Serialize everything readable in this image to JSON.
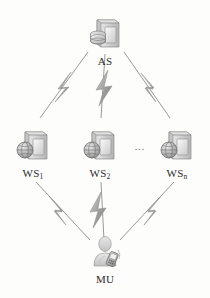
{
  "figure": {
    "type": "network-topology-diagram",
    "background_color": "#fdfdfc",
    "line_color": "#8d8d8d",
    "bolt_color": "#a8a8a8",
    "label_color": "#2b2b2b",
    "ellipsis": "..."
  },
  "nodes": [
    {
      "id": "as",
      "label": "AS",
      "label_base": "AS",
      "label_sub": "",
      "icon": "server-database-icon",
      "tier": "top",
      "x": 105,
      "y": 14
    },
    {
      "id": "ws1",
      "label": "WS1",
      "label_base": "WS",
      "label_sub": "1",
      "icon": "web-server-globe-icon",
      "tier": "middle",
      "x": 33,
      "y": 126
    },
    {
      "id": "ws2",
      "label": "WS2",
      "label_base": "WS",
      "label_sub": "2",
      "icon": "web-server-globe-icon",
      "tier": "middle",
      "x": 100,
      "y": 126
    },
    {
      "id": "wsn",
      "label": "WSn",
      "label_base": "WS",
      "label_sub": "n",
      "icon": "web-server-globe-icon",
      "tier": "middle",
      "x": 177,
      "y": 126
    },
    {
      "id": "mu",
      "label": "MU",
      "label_base": "MU",
      "label_sub": "",
      "icon": "mobile-user-icon",
      "tier": "bottom",
      "x": 105,
      "y": 232
    }
  ],
  "links": [
    {
      "id": "as-ws1",
      "from": "AS",
      "to": "WS1",
      "style": "lightning"
    },
    {
      "id": "as-ws2",
      "from": "AS",
      "to": "WS2",
      "style": "lightning"
    },
    {
      "id": "as-wsn",
      "from": "AS",
      "to": "WSn",
      "style": "lightning"
    },
    {
      "id": "ws1-mu",
      "from": "WS1",
      "to": "MU",
      "style": "lightning"
    },
    {
      "id": "ws2-mu",
      "from": "WS2",
      "to": "MU",
      "style": "lightning"
    },
    {
      "id": "wsn-mu",
      "from": "WSn",
      "to": "MU",
      "style": "lightning"
    }
  ],
  "ellipsis_marker": {
    "text": "...",
    "x": 140,
    "y": 146
  }
}
